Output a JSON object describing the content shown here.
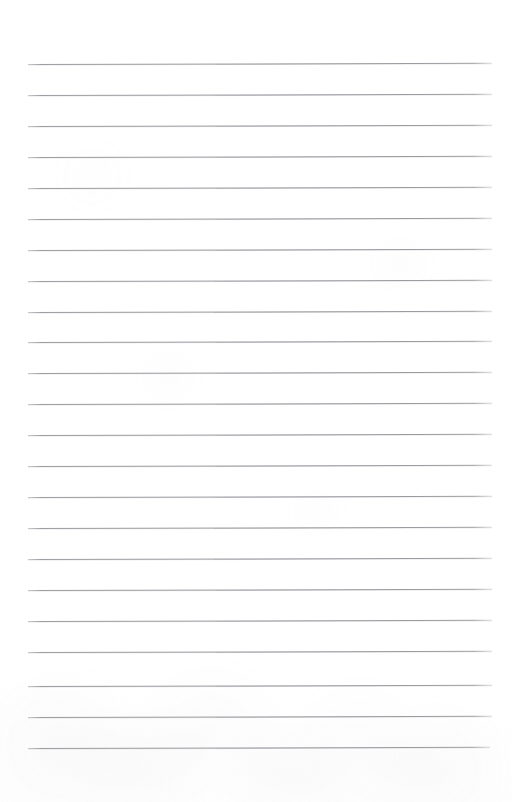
{
  "document": {
    "type": "scanned-lined-paper",
    "title": "Blank Lined Writing Paper",
    "page_width": 512,
    "page_height": 802,
    "paper_color": "#ffffff",
    "rule_color": "#94949a",
    "has_text_content": false,
    "content_text": ""
  },
  "ruling": {
    "line_count": 23,
    "first_line_y": 64,
    "line_spacing": 30.8,
    "line_start_x": 28,
    "line_end_x": 492,
    "line_thickness": 1,
    "tilt_degrees": -0.15,
    "lines": [
      {
        "index": 1,
        "y": 64,
        "x_start": 28,
        "x_end": 492
      },
      {
        "index": 2,
        "y": 95,
        "x_start": 28,
        "x_end": 492
      },
      {
        "index": 3,
        "y": 126,
        "x_start": 28,
        "x_end": 492
      },
      {
        "index": 4,
        "y": 157,
        "x_start": 28,
        "x_end": 492
      },
      {
        "index": 5,
        "y": 188,
        "x_start": 28,
        "x_end": 492
      },
      {
        "index": 6,
        "y": 219,
        "x_start": 28,
        "x_end": 492
      },
      {
        "index": 7,
        "y": 250,
        "x_start": 28,
        "x_end": 492
      },
      {
        "index": 8,
        "y": 281,
        "x_start": 28,
        "x_end": 492
      },
      {
        "index": 9,
        "y": 312,
        "x_start": 28,
        "x_end": 492
      },
      {
        "index": 10,
        "y": 342,
        "x_start": 28,
        "x_end": 492
      },
      {
        "index": 11,
        "y": 373,
        "x_start": 28,
        "x_end": 492
      },
      {
        "index": 12,
        "y": 404,
        "x_start": 28,
        "x_end": 492
      },
      {
        "index": 13,
        "y": 435,
        "x_start": 28,
        "x_end": 492
      },
      {
        "index": 14,
        "y": 466,
        "x_start": 28,
        "x_end": 492
      },
      {
        "index": 15,
        "y": 497,
        "x_start": 28,
        "x_end": 492
      },
      {
        "index": 16,
        "y": 528,
        "x_start": 28,
        "x_end": 492
      },
      {
        "index": 17,
        "y": 559,
        "x_start": 28,
        "x_end": 492
      },
      {
        "index": 18,
        "y": 590,
        "x_start": 28,
        "x_end": 492
      },
      {
        "index": 19,
        "y": 621,
        "x_start": 28,
        "x_end": 492
      },
      {
        "index": 20,
        "y": 652,
        "x_start": 28,
        "x_end": 492
      },
      {
        "index": 21,
        "y": 686,
        "x_start": 28,
        "x_end": 492
      },
      {
        "index": 22,
        "y": 717,
        "x_start": 28,
        "x_end": 492
      },
      {
        "index": 23,
        "y": 748,
        "x_start": 28,
        "x_end": 490
      }
    ]
  },
  "margins": {
    "top": 64,
    "bottom": 54,
    "left": 28,
    "right": 20
  }
}
